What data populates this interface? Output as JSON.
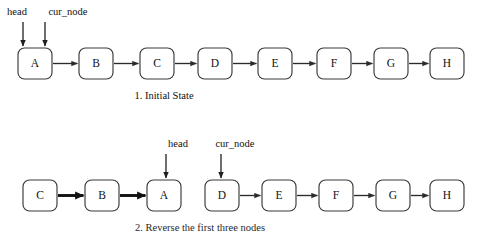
{
  "figure": {
    "background_color": "#ffffff",
    "box_stroke_color": "#3a3a3a",
    "box_fill_color": "#ffffff",
    "arrow_color": "#2b2b2b",
    "text_color": "#101010",
    "width": 483,
    "height": 233
  },
  "rows": [
    {
      "id": "row-1",
      "caption": "1. Initial State",
      "caption_x": 164,
      "caption_y": 99,
      "box_y": 48,
      "box_h": 31,
      "nodes": [
        {
          "label": "A",
          "x": 18,
          "w": 34
        },
        {
          "label": "B",
          "x": 79,
          "w": 34
        },
        {
          "label": "C",
          "x": 140,
          "w": 34
        },
        {
          "label": "D",
          "x": 198,
          "w": 34
        },
        {
          "label": "E",
          "x": 258,
          "w": 34
        },
        {
          "label": "F",
          "x": 317,
          "w": 34
        },
        {
          "label": "G",
          "x": 374,
          "w": 34
        },
        {
          "label": "H",
          "x": 430,
          "w": 34
        }
      ],
      "links": [
        {
          "from": 0,
          "to": 1,
          "bold": false
        },
        {
          "from": 1,
          "to": 2,
          "bold": false
        },
        {
          "from": 2,
          "to": 3,
          "bold": false
        },
        {
          "from": 3,
          "to": 4,
          "bold": false
        },
        {
          "from": 4,
          "to": 5,
          "bold": false
        },
        {
          "from": 5,
          "to": 6,
          "bold": false
        },
        {
          "from": 6,
          "to": 7,
          "bold": false
        }
      ],
      "pointers": [
        {
          "name": "head",
          "label_x": 17,
          "label_y": 15,
          "arrow_x": 23,
          "arrow_top": 22,
          "arrow_bottom": 46
        },
        {
          "name": "cur_node",
          "label_x": 68,
          "label_y": 15,
          "arrow_x": 45,
          "arrow_top": 22,
          "arrow_bottom": 46
        }
      ]
    },
    {
      "id": "row-2",
      "caption": "2. Reverse the first three nodes",
      "caption_x": 200,
      "caption_y": 231,
      "box_y": 180,
      "box_h": 31,
      "nodes": [
        {
          "label": "C",
          "x": 23,
          "w": 34
        },
        {
          "label": "B",
          "x": 85,
          "w": 34
        },
        {
          "label": "A",
          "x": 147,
          "w": 34
        },
        {
          "label": "D",
          "x": 205,
          "w": 34
        },
        {
          "label": "E",
          "x": 262,
          "w": 34
        },
        {
          "label": "F",
          "x": 319,
          "w": 34
        },
        {
          "label": "G",
          "x": 376,
          "w": 34
        },
        {
          "label": "H",
          "x": 430,
          "w": 34
        }
      ],
      "links": [
        {
          "from": 0,
          "to": 1,
          "bold": true
        },
        {
          "from": 1,
          "to": 2,
          "bold": true
        },
        {
          "from": 3,
          "to": 4,
          "bold": false
        },
        {
          "from": 4,
          "to": 5,
          "bold": false
        },
        {
          "from": 5,
          "to": 6,
          "bold": false
        },
        {
          "from": 6,
          "to": 7,
          "bold": false
        }
      ],
      "pointers": [
        {
          "name": "head",
          "label_x": 178,
          "label_y": 147,
          "arrow_x": 166,
          "arrow_top": 154,
          "arrow_bottom": 178
        },
        {
          "name": "cur_node",
          "label_x": 235,
          "label_y": 147,
          "arrow_x": 221,
          "arrow_top": 154,
          "arrow_bottom": 178
        }
      ]
    }
  ]
}
